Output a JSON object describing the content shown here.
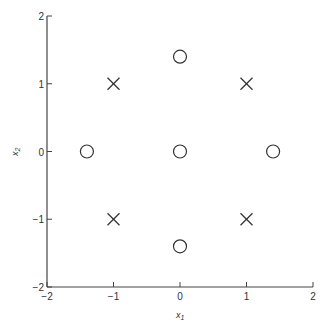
{
  "chart_data": {
    "type": "scatter",
    "title": "",
    "xlabel": "x1",
    "ylabel": "x2",
    "xlim": [
      -2,
      2
    ],
    "ylim": [
      -2,
      2
    ],
    "xticks": [
      -2,
      -1,
      0,
      1,
      2
    ],
    "yticks": [
      -2,
      -1,
      0,
      1,
      2
    ],
    "grid": false,
    "series": [
      {
        "name": "cross",
        "marker": "x",
        "points": [
          [
            -1,
            1
          ],
          [
            1,
            1
          ],
          [
            -1,
            -1
          ],
          [
            1,
            -1
          ]
        ]
      },
      {
        "name": "circle",
        "marker": "o",
        "points": [
          [
            0,
            1.4
          ],
          [
            -1.4,
            0
          ],
          [
            0,
            0
          ],
          [
            1.4,
            0
          ],
          [
            0,
            -1.4
          ]
        ]
      }
    ]
  },
  "labels": {
    "xlabel_main": "x",
    "xlabel_sub": "1",
    "ylabel_main": "x",
    "ylabel_sub": "2"
  }
}
